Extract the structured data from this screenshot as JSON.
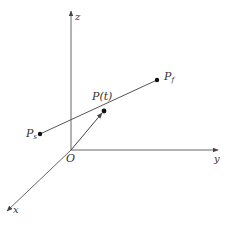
{
  "diagram": {
    "type": "3d-coordinate-axes-with-line-segment",
    "colors": {
      "background": "#ffffff",
      "stroke": "#555555",
      "text": "#333333",
      "point": "#111111"
    },
    "origin": {
      "label": "O",
      "x": 71,
      "y": 150
    },
    "axes": {
      "z": {
        "label": "z",
        "end": {
          "x": 71,
          "y": 10
        }
      },
      "y": {
        "label": "y",
        "end": {
          "x": 219,
          "y": 150
        }
      },
      "x": {
        "label": "x",
        "end": {
          "x": 6,
          "y": 212
        }
      }
    },
    "points": {
      "start": {
        "label": "P",
        "sub": "s",
        "x": 40,
        "y": 134
      },
      "final": {
        "label": "P",
        "sub": "f",
        "x": 157,
        "y": 80
      },
      "param": {
        "label": "P(t)",
        "x": 104,
        "y": 111
      }
    },
    "segments": [
      {
        "from": "start",
        "to": "final",
        "kind": "line"
      },
      {
        "from": "origin",
        "to": "param",
        "kind": "vector"
      }
    ]
  }
}
